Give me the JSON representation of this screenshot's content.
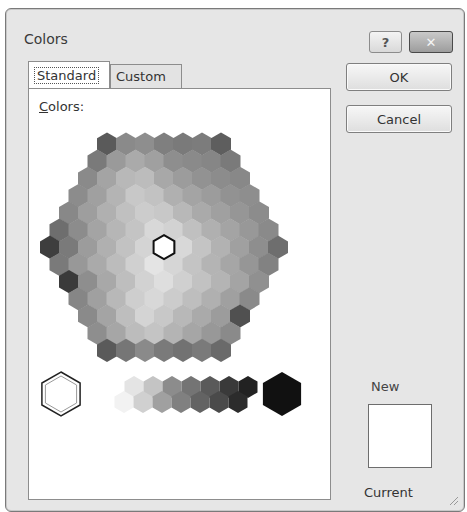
{
  "window": {
    "title": "Colors",
    "help_label": "?",
    "close_label": "✕"
  },
  "tabs": [
    {
      "label": "Standard",
      "active": true
    },
    {
      "label": "Custom",
      "active": false
    }
  ],
  "panel": {
    "colors_label_first": "C",
    "colors_label_rest": "olors:"
  },
  "buttons": {
    "ok": "OK",
    "cancel": "Cancel"
  },
  "preview": {
    "new_label": "New",
    "current_label": "Current",
    "new_color": "#ffffff"
  },
  "honeycomb": {
    "row_counts": [
      7,
      8,
      9,
      10,
      11,
      12,
      13,
      12,
      11,
      10,
      9,
      8,
      7
    ],
    "rows": [
      [
        "#5a5a5a",
        "#8a8a8a",
        "#8e8e8e",
        "#7f7f7f",
        "#7a7a7a",
        "#7c7c7c",
        "#5e5e5e"
      ],
      [
        "#7a7a7a",
        "#9a9a9a",
        "#aaaaaa",
        "#a0a0a0",
        "#8e8e8e",
        "#8a8a8a",
        "#868686",
        "#7a7a7a"
      ],
      [
        "#8a8a8a",
        "#a4a4a4",
        "#b8b8b8",
        "#bcbcbc",
        "#a8a8a8",
        "#9c9c9c",
        "#929292",
        "#8c8c8c",
        "#888888"
      ],
      [
        "#8c8c8c",
        "#a0a0a0",
        "#b4b4b4",
        "#c8c8c8",
        "#c2c2c2",
        "#b0b0b0",
        "#a4a4a4",
        "#9c9c9c",
        "#929292",
        "#8e8e8e"
      ],
      [
        "#888888",
        "#9e9e9e",
        "#b0b0b0",
        "#c0c0c0",
        "#cccccc",
        "#c8c8c8",
        "#b8b8b8",
        "#aaaaaa",
        "#a0a0a0",
        "#969696",
        "#8c8c8c"
      ],
      [
        "#6e6e6e",
        "#8c8c8c",
        "#a4a4a4",
        "#b6b6b6",
        "#c4c4c4",
        "#d8d8d8",
        "#d2d2d2",
        "#c0c0c0",
        "#b0b0b0",
        "#a4a4a4",
        "#989898",
        "#8a8a8a"
      ],
      [
        "#3e3e3e",
        "#7a7a7a",
        "#9c9c9c",
        "#b0b0b0",
        "#c2c2c2",
        "#d4d4d4",
        "#ffffff",
        "#d8d8d8",
        "#c4c4c4",
        "#b2b2b2",
        "#a0a0a0",
        "#8e8e8e",
        "#6e6e6e"
      ],
      [
        "#7a7a7a",
        "#989898",
        "#aaaaaa",
        "#bcbcbc",
        "#d0d0d0",
        "#e4e4e4",
        "#d6d6d6",
        "#c4c4c4",
        "#b4b4b4",
        "#a6a6a6",
        "#969696",
        "#828282"
      ],
      [
        "#3a3a3a",
        "#8e8e8e",
        "#a8a8a8",
        "#bebebe",
        "#d2d2d2",
        "#dedede",
        "#d0d0d0",
        "#c2c2c2",
        "#b4b4b4",
        "#a4a4a4",
        "#909090"
      ],
      [
        "#868686",
        "#a0a0a0",
        "#b8b8b8",
        "#cecece",
        "#d8d8d8",
        "#cccccc",
        "#bebebe",
        "#b0b0b0",
        "#a0a0a0",
        "#8a8a8a"
      ],
      [
        "#8a8a8a",
        "#a4a4a4",
        "#bebebe",
        "#d4d4d4",
        "#c8c8c8",
        "#b8b8b8",
        "#aaaaaa",
        "#9c9c9c",
        "#505050"
      ],
      [
        "#8e8e8e",
        "#a6a6a6",
        "#bcbcbc",
        "#c4c4c4",
        "#b4b4b4",
        "#a6a6a6",
        "#989898",
        "#8a8a8a"
      ],
      [
        "#5a5a5a",
        "#767676",
        "#8a8a8a",
        "#7a7a7a",
        "#727272",
        "#7a7a7a",
        "#6a6a6a"
      ]
    ],
    "selected": {
      "row": 6,
      "col": 6
    }
  },
  "grayscale": {
    "top_row": [
      "#e4e4e4",
      "#c4c4c4",
      "#8c8c8c",
      "#747474",
      "#5a5a5a",
      "#3a3a3a",
      "#222222"
    ],
    "bottom_row": [
      "#f2f2f2",
      "#d0d0d0",
      "#a0a0a0",
      "#808080",
      "#636363",
      "#4a4a4a",
      "#2c2c2c"
    ],
    "big_white": "#ffffff",
    "big_black": "#111111"
  }
}
